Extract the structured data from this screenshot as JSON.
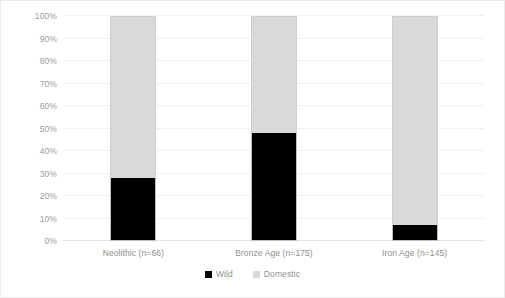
{
  "chart_data": {
    "type": "bar",
    "subtype": "stacked-100-percent",
    "title": "",
    "xlabel": "",
    "ylabel": "",
    "categories": [
      "Neolithic (n=66)",
      "Bronze Age (n=175)",
      "Iron Age (n=145)"
    ],
    "series": [
      {
        "name": "Wild",
        "color": "#000000",
        "values": [
          28,
          48,
          7
        ]
      },
      {
        "name": "Domestic",
        "color": "#d9d9d9",
        "values": [
          72,
          52,
          93
        ]
      }
    ],
    "ylim": [
      0,
      100
    ],
    "ytick_labels": [
      "0%",
      "10%",
      "20%",
      "30%",
      "40%",
      "50%",
      "60%",
      "70%",
      "80%",
      "90%",
      "100%"
    ],
    "ytick_values": [
      0,
      10,
      20,
      30,
      40,
      50,
      60,
      70,
      80,
      90,
      100
    ],
    "grid": true,
    "grid_axis": "y",
    "legend_position": "bottom",
    "background_color": "#ffffff",
    "gridline_color": "#eff0f0",
    "axis_text_color": "#8e8e8e"
  },
  "legend": {
    "items": [
      {
        "label": "Wild",
        "swatch": "wild"
      },
      {
        "label": "Domestic",
        "swatch": "domestic"
      }
    ]
  }
}
